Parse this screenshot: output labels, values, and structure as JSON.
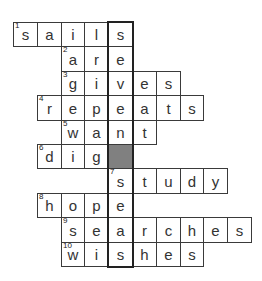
{
  "puzzle": {
    "grid_origin": {
      "x": 13,
      "y": 22
    },
    "cell_w": 23.8,
    "cell_h": 24.4,
    "highlight_col": 4,
    "highlight_word": "seven seas",
    "shaded_color": "#808080",
    "rows": [
      {
        "number": "1",
        "start_col": 0,
        "letters": [
          "s",
          "a",
          "i",
          "l",
          "s"
        ]
      },
      {
        "number": "2",
        "start_col": 2,
        "letters": [
          "a",
          "r",
          "e"
        ]
      },
      {
        "number": "3",
        "start_col": 2,
        "letters": [
          "g",
          "i",
          "v",
          "e",
          "s"
        ]
      },
      {
        "number": "4",
        "start_col": 1,
        "letters": [
          "r",
          "e",
          "p",
          "e",
          "a",
          "t",
          "s"
        ]
      },
      {
        "number": "5",
        "start_col": 2,
        "letters": [
          "w",
          "a",
          "n",
          "t"
        ]
      },
      {
        "number": "6",
        "start_col": 1,
        "letters": [
          "d",
          "i",
          "g",
          ""
        ],
        "shaded_col": 4
      },
      {
        "number": "7",
        "start_col": 4,
        "letters": [
          "s",
          "t",
          "u",
          "d",
          "y"
        ]
      },
      {
        "number": "8",
        "start_col": 1,
        "letters": [
          "h",
          "o",
          "p",
          "e"
        ]
      },
      {
        "number": "9",
        "start_col": 2,
        "letters": [
          "s",
          "e",
          "a",
          "r",
          "c",
          "h",
          "e",
          "s"
        ]
      },
      {
        "number": "10",
        "start_col": 2,
        "letters": [
          "w",
          "i",
          "s",
          "h",
          "e",
          "s"
        ]
      }
    ]
  }
}
